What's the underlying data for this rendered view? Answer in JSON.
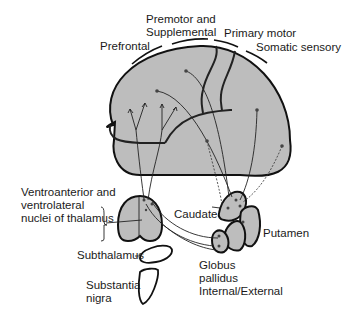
{
  "diagram": {
    "type": "anatomical connectivity diagram",
    "cortical_regions": {
      "prefrontal": "Prefrontal",
      "premotor": "Premotor and\nSupplemental",
      "premotor_line1": "Premotor and",
      "premotor_line2": "Supplemental",
      "primary_motor": "Primary motor",
      "somatic_sensory": "Somatic sensory"
    },
    "subcortical": {
      "thalamus_line1": "Ventroanterior and",
      "thalamus_line2": "ventrolateral",
      "thalamus_line3": "nuclei of thalamus",
      "caudate": "Caudate",
      "putamen": "Putamen",
      "globus_line1": "Globus",
      "globus_line2": "pallidus",
      "globus_line3": "Internal/External",
      "subthalamus": "Subthalamus",
      "substantia_line1": "Substantia",
      "substantia_line2": "nigra"
    },
    "colors": {
      "structure_fill": "#bdbdbd",
      "outline": "#111111",
      "background": "#ffffff"
    }
  }
}
